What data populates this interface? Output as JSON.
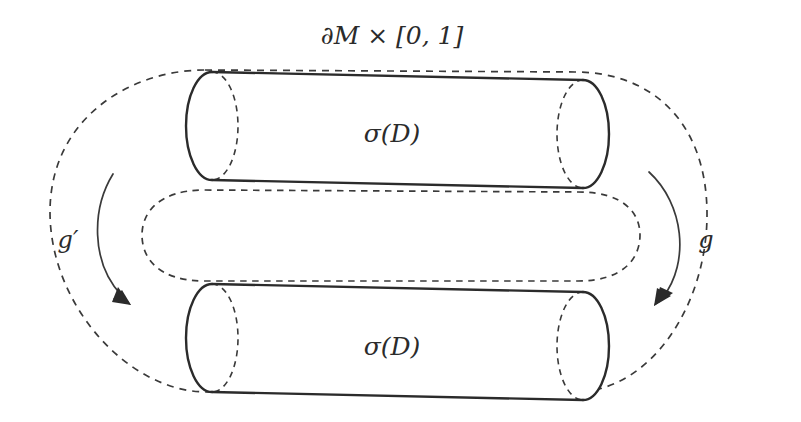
{
  "figure": {
    "title": "∂M × [0, 1]",
    "title_name": "boundary-collar-label",
    "background_color": "#ffffff",
    "ink_color": "#2b2b2b",
    "dash_color": "#3a3a3a",
    "labels": {
      "upper_cylinder": "σ(D)",
      "lower_cylinder": "σ(D)",
      "left_map": "g′",
      "right_map": "g"
    },
    "regions": {
      "outer_boundary_name": "outer-dashed-stadium",
      "inner_boundary_name": "inner-dashed-stadium",
      "upper_cylinder_name": "upper-cylinder",
      "lower_cylinder_name": "lower-cylinder"
    },
    "arrows": {
      "left": {
        "label": "g′",
        "direction": "down-right"
      },
      "right": {
        "label": "g",
        "direction": "down-left"
      }
    }
  }
}
